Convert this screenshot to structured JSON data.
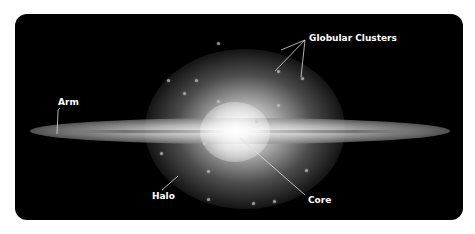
{
  "diagram": {
    "background_color": "#000000",
    "labels": {
      "globular_clusters": "Globular Clusters",
      "arm": "Arm",
      "halo": "Halo",
      "core": "Core"
    }
  }
}
